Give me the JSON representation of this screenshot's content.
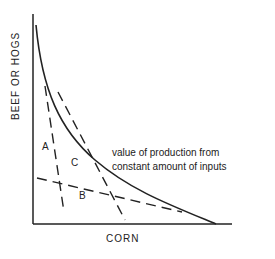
{
  "diagram": {
    "x_axis_label": "CORN",
    "y_axis_label": "BEEF OR HOGS",
    "region_labels": {
      "a": "A",
      "b": "B",
      "c": "C"
    },
    "annotation": {
      "line1": "value of production from",
      "line2": "constant amount of inputs"
    },
    "colors": {
      "ink": "#222222",
      "background": "#ffffff"
    }
  }
}
